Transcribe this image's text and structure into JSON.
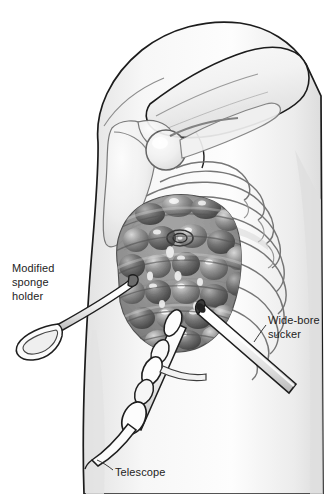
{
  "figure": {
    "view": "lateral chest wall, arm abducted overhead",
    "background_color": "#ffffff",
    "ink_color": "#232323",
    "skin_shade": "#f4f4f4",
    "bone_shade": "#e8e8e8",
    "lung_shade": "#8d8d8d",
    "instrument_shade": "#fbfbfb"
  },
  "labels": {
    "sponge_holder": {
      "lines": [
        "Modified",
        "sponge",
        "holder"
      ],
      "text": "Modified\nsponge\nholder",
      "position": "left"
    },
    "sucker": {
      "lines": [
        "Wide-bore",
        "sucker"
      ],
      "text": "Wide-bore\nsucker",
      "position": "right"
    },
    "telescope": {
      "lines": [
        "Telescope"
      ],
      "text": "Telescope",
      "position": "bottom"
    }
  },
  "anatomy": {
    "parts": [
      {
        "name": "torso-outline",
        "label": "Lateral chest wall and flank"
      },
      {
        "name": "arm",
        "label": "Abducted upper arm"
      },
      {
        "name": "humeral-head",
        "label": "Head of humerus"
      },
      {
        "name": "scapula",
        "label": "Scapula"
      },
      {
        "name": "clavicle",
        "label": "Clavicle"
      },
      {
        "name": "rib-cage",
        "label": "Rib cage, ribs 1-10"
      },
      {
        "name": "lung",
        "label": "Bullous emphysematous lung"
      },
      {
        "name": "bulla-target",
        "label": "Target bulla marked with ring"
      }
    ],
    "rib_count": 10
  },
  "instruments": [
    {
      "name": "modified-sponge-holder",
      "label": "Modified sponge holder",
      "entry_point": "anterior axillary port, upper",
      "shape": "long thin shaft with teardrop ring handle"
    },
    {
      "name": "wide-bore-sucker",
      "label": "Wide-bore sucker",
      "entry_point": "posterior port, mid-chest",
      "shape": "thick straight tube with open bevelled tip"
    },
    {
      "name": "telescope",
      "label": "Telescope",
      "entry_point": "inferior camera port",
      "shape": "segmented shaft with collars and trailing light cable"
    }
  ]
}
